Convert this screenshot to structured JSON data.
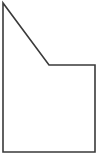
{
  "canvas": {
    "width": 99,
    "height": 158,
    "background_color": "#ffffff"
  },
  "figure": {
    "name": "pentagon-notched-rectangle",
    "fill_color": "#ffffff",
    "stroke_color": "#3a3a3a",
    "stroke_width": 1.6,
    "vertex_count": 5,
    "points": "3,3 3,152 95,152 95,65 49,65",
    "vertices": [
      {
        "label": "top-left-apex",
        "x": 3,
        "y": 3
      },
      {
        "label": "bottom-left",
        "x": 3,
        "y": 152
      },
      {
        "label": "bottom-right",
        "x": 95,
        "y": 152
      },
      {
        "label": "top-right",
        "x": 95,
        "y": 65
      },
      {
        "label": "notch-inner-corner",
        "x": 49,
        "y": 65
      }
    ],
    "edges": [
      {
        "name": "left-edge",
        "from": "top-left-apex",
        "to": "bottom-left",
        "orientation": "vertical"
      },
      {
        "name": "bottom-edge",
        "from": "bottom-left",
        "to": "bottom-right",
        "orientation": "horizontal"
      },
      {
        "name": "right-edge",
        "from": "bottom-right",
        "to": "top-right",
        "orientation": "vertical"
      },
      {
        "name": "ledge-edge",
        "from": "top-right",
        "to": "notch-inner-corner",
        "orientation": "horizontal"
      },
      {
        "name": "diagonal-edge",
        "from": "notch-inner-corner",
        "to": "top-left-apex",
        "orientation": "diagonal"
      }
    ]
  }
}
